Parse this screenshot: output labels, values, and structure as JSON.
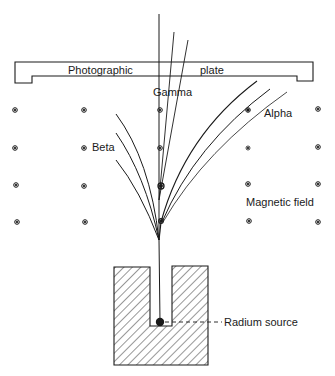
{
  "figure": {
    "labels": {
      "plate_left": "Photographic",
      "plate_right": "plate",
      "gamma": "Gamma",
      "alpha": "Alpha",
      "beta": "Beta",
      "field": "Magnetic field",
      "source": "Radium source"
    },
    "colors": {
      "ink": "#1a1a1a",
      "background": "#ffffff"
    },
    "field_markers": {
      "symbol": "dot-in-circle (field out of page)",
      "columns_x": [
        15,
        84,
        160,
        248,
        318
      ],
      "rows_y": [
        110,
        148,
        185,
        222
      ]
    }
  }
}
